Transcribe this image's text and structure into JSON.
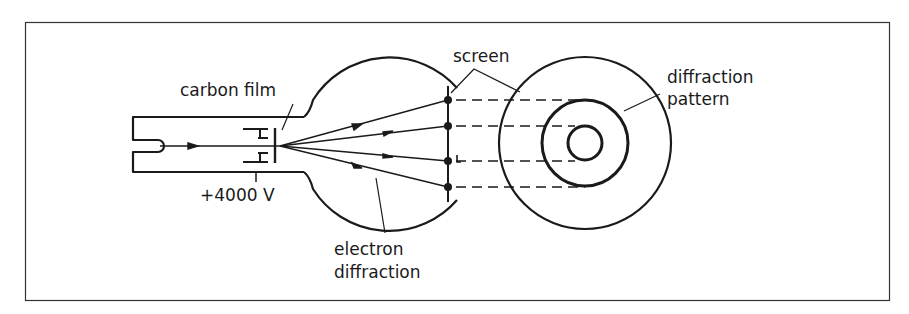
{
  "figure": {
    "labels": {
      "carbon_film": "carbon film",
      "voltage": "+4000 V",
      "electron_diffraction_line1": "electron",
      "electron_diffraction_line2": "diffraction",
      "screen": "screen",
      "diffraction_pattern_line1": "diffraction",
      "diffraction_pattern_line2": "pattern"
    },
    "colors": {
      "ink": "#1a1a1a",
      "background": "#ffffff"
    },
    "components": [
      "electron gun",
      "anode cylinder",
      "carbon film",
      "glass bulb",
      "fluorescent screen",
      "diffraction rings"
    ],
    "diffraction_rings": {
      "count": 2,
      "ring_radii_px": [
        17,
        43
      ],
      "screen_radius_px": 86
    },
    "beam_count": 4
  }
}
